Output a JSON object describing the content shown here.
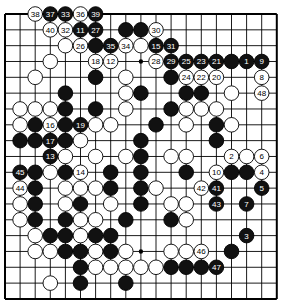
{
  "board": {
    "size": 19,
    "origin_x": 5,
    "origin_y": 14,
    "step_x": 15.1,
    "step_y": 15.83,
    "stone_radius": 7.3,
    "colors": {
      "line": "#000000",
      "black_stone": "#111111",
      "white_stone": "#ffffff",
      "black_label": "#ffffff",
      "white_label": "#000000"
    },
    "star_points": [
      [
        9,
        3
      ],
      [
        9,
        15
      ]
    ],
    "stones": [
      {
        "c": 2,
        "r": 0,
        "color": "W",
        "label": "38"
      },
      {
        "c": 3,
        "r": 0,
        "color": "B",
        "label": "37"
      },
      {
        "c": 4,
        "r": 0,
        "color": "B",
        "label": "33"
      },
      {
        "c": 5,
        "r": 0,
        "color": "W",
        "label": "36"
      },
      {
        "c": 6,
        "r": 0,
        "color": "B",
        "label": "39"
      },
      {
        "c": 3,
        "r": 1,
        "color": "W",
        "label": "40"
      },
      {
        "c": 4,
        "r": 1,
        "color": "W",
        "label": "32"
      },
      {
        "c": 5,
        "r": 1,
        "color": "B",
        "label": "11"
      },
      {
        "c": 6,
        "r": 1,
        "color": "B",
        "label": "27"
      },
      {
        "c": 8,
        "r": 1,
        "color": "B",
        "label": ""
      },
      {
        "c": 9,
        "r": 1,
        "color": "B",
        "label": ""
      },
      {
        "c": 10,
        "r": 1,
        "color": "W",
        "label": "30"
      },
      {
        "c": 4,
        "r": 2,
        "color": "W",
        "label": ""
      },
      {
        "c": 5,
        "r": 2,
        "color": "W",
        "label": "26"
      },
      {
        "c": 6,
        "r": 2,
        "color": "B",
        "label": ""
      },
      {
        "c": 7,
        "r": 2,
        "color": "B",
        "label": "35"
      },
      {
        "c": 8,
        "r": 2,
        "color": "W",
        "label": "34"
      },
      {
        "c": 9,
        "r": 2,
        "color": "W",
        "label": ""
      },
      {
        "c": 10,
        "r": 2,
        "color": "B",
        "label": "15"
      },
      {
        "c": 11,
        "r": 2,
        "color": "B",
        "label": "31"
      },
      {
        "c": 3,
        "r": 3,
        "color": "W",
        "label": ""
      },
      {
        "c": 6,
        "r": 3,
        "color": "W",
        "label": "18"
      },
      {
        "c": 7,
        "r": 3,
        "color": "W",
        "label": "12"
      },
      {
        "c": 10,
        "r": 3,
        "color": "W",
        "label": "28"
      },
      {
        "c": 11,
        "r": 3,
        "color": "B",
        "label": "29"
      },
      {
        "c": 12,
        "r": 3,
        "color": "B",
        "label": "25"
      },
      {
        "c": 13,
        "r": 3,
        "color": "B",
        "label": "23"
      },
      {
        "c": 14,
        "r": 3,
        "color": "B",
        "label": "21"
      },
      {
        "c": 15,
        "r": 3,
        "color": "B",
        "label": ""
      },
      {
        "c": 16,
        "r": 3,
        "color": "B",
        "label": "1"
      },
      {
        "c": 17,
        "r": 3,
        "color": "B",
        "label": "9"
      },
      {
        "c": 2,
        "r": 4,
        "color": "W",
        "label": ""
      },
      {
        "c": 6,
        "r": 4,
        "color": "B",
        "label": ""
      },
      {
        "c": 8,
        "r": 4,
        "color": "W",
        "label": ""
      },
      {
        "c": 11,
        "r": 4,
        "color": "B",
        "label": ""
      },
      {
        "c": 12,
        "r": 4,
        "color": "W",
        "label": "24"
      },
      {
        "c": 13,
        "r": 4,
        "color": "W",
        "label": "22"
      },
      {
        "c": 14,
        "r": 4,
        "color": "W",
        "label": "20"
      },
      {
        "c": 17,
        "r": 4,
        "color": "W",
        "label": "8"
      },
      {
        "c": 4,
        "r": 5,
        "color": "B",
        "label": ""
      },
      {
        "c": 8,
        "r": 5,
        "color": "W",
        "label": ""
      },
      {
        "c": 9,
        "r": 5,
        "color": "B",
        "label": ""
      },
      {
        "c": 12,
        "r": 5,
        "color": "B",
        "label": ""
      },
      {
        "c": 13,
        "r": 5,
        "color": "B",
        "label": ""
      },
      {
        "c": 15,
        "r": 5,
        "color": "W",
        "label": ""
      },
      {
        "c": 17,
        "r": 5,
        "color": "W",
        "label": "48"
      },
      {
        "c": 1,
        "r": 6,
        "color": "W",
        "label": ""
      },
      {
        "c": 2,
        "r": 6,
        "color": "W",
        "label": ""
      },
      {
        "c": 3,
        "r": 6,
        "color": "W",
        "label": ""
      },
      {
        "c": 4,
        "r": 6,
        "color": "B",
        "label": ""
      },
      {
        "c": 6,
        "r": 6,
        "color": "B",
        "label": ""
      },
      {
        "c": 8,
        "r": 6,
        "color": "W",
        "label": ""
      },
      {
        "c": 11,
        "r": 6,
        "color": "B",
        "label": ""
      },
      {
        "c": 12,
        "r": 6,
        "color": "W",
        "label": ""
      },
      {
        "c": 13,
        "r": 6,
        "color": "W",
        "label": ""
      },
      {
        "c": 14,
        "r": 6,
        "color": "W",
        "label": ""
      },
      {
        "c": 1,
        "r": 7,
        "color": "W",
        "label": ""
      },
      {
        "c": 2,
        "r": 7,
        "color": "B",
        "label": ""
      },
      {
        "c": 3,
        "r": 7,
        "color": "W",
        "label": "16"
      },
      {
        "c": 4,
        "r": 7,
        "color": "B",
        "label": ""
      },
      {
        "c": 5,
        "r": 7,
        "color": "B",
        "label": "19"
      },
      {
        "c": 6,
        "r": 7,
        "color": "W",
        "label": ""
      },
      {
        "c": 7,
        "r": 7,
        "color": "W",
        "label": ""
      },
      {
        "c": 10,
        "r": 7,
        "color": "B",
        "label": ""
      },
      {
        "c": 12,
        "r": 7,
        "color": "W",
        "label": ""
      },
      {
        "c": 14,
        "r": 7,
        "color": "B",
        "label": ""
      },
      {
        "c": 15,
        "r": 7,
        "color": "W",
        "label": ""
      },
      {
        "c": 1,
        "r": 8,
        "color": "B",
        "label": ""
      },
      {
        "c": 2,
        "r": 8,
        "color": "B",
        "label": ""
      },
      {
        "c": 3,
        "r": 8,
        "color": "B",
        "label": "17"
      },
      {
        "c": 4,
        "r": 8,
        "color": "B",
        "label": ""
      },
      {
        "c": 5,
        "r": 8,
        "color": "W",
        "label": ""
      },
      {
        "c": 9,
        "r": 8,
        "color": "B",
        "label": ""
      },
      {
        "c": 14,
        "r": 8,
        "color": "B",
        "label": ""
      },
      {
        "c": 3,
        "r": 9,
        "color": "B",
        "label": "13"
      },
      {
        "c": 4,
        "r": 9,
        "color": "W",
        "label": ""
      },
      {
        "c": 6,
        "r": 9,
        "color": "W",
        "label": ""
      },
      {
        "c": 8,
        "r": 9,
        "color": "W",
        "label": ""
      },
      {
        "c": 9,
        "r": 9,
        "color": "B",
        "label": ""
      },
      {
        "c": 11,
        "r": 9,
        "color": "W",
        "label": ""
      },
      {
        "c": 12,
        "r": 9,
        "color": "W",
        "label": ""
      },
      {
        "c": 15,
        "r": 9,
        "color": "W",
        "label": "2"
      },
      {
        "c": 16,
        "r": 9,
        "color": "W",
        "label": ""
      },
      {
        "c": 17,
        "r": 9,
        "color": "W",
        "label": "6"
      },
      {
        "c": 1,
        "r": 10,
        "color": "B",
        "label": "45"
      },
      {
        "c": 2,
        "r": 10,
        "color": "B",
        "label": ""
      },
      {
        "c": 3,
        "r": 10,
        "color": "W",
        "label": ""
      },
      {
        "c": 4,
        "r": 10,
        "color": "B",
        "label": ""
      },
      {
        "c": 5,
        "r": 10,
        "color": "W",
        "label": "14"
      },
      {
        "c": 7,
        "r": 10,
        "color": "B",
        "label": ""
      },
      {
        "c": 9,
        "r": 10,
        "color": "B",
        "label": ""
      },
      {
        "c": 12,
        "r": 10,
        "color": "B",
        "label": ""
      },
      {
        "c": 14,
        "r": 10,
        "color": "W",
        "label": "10"
      },
      {
        "c": 15,
        "r": 10,
        "color": "B",
        "label": ""
      },
      {
        "c": 16,
        "r": 10,
        "color": "B",
        "label": ""
      },
      {
        "c": 17,
        "r": 10,
        "color": "W",
        "label": "4"
      },
      {
        "c": 1,
        "r": 11,
        "color": "W",
        "label": "44"
      },
      {
        "c": 2,
        "r": 11,
        "color": "B",
        "label": ""
      },
      {
        "c": 4,
        "r": 11,
        "color": "W",
        "label": ""
      },
      {
        "c": 5,
        "r": 11,
        "color": "W",
        "label": ""
      },
      {
        "c": 6,
        "r": 11,
        "color": "W",
        "label": ""
      },
      {
        "c": 7,
        "r": 11,
        "color": "B",
        "label": ""
      },
      {
        "c": 9,
        "r": 11,
        "color": "B",
        "label": ""
      },
      {
        "c": 10,
        "r": 11,
        "color": "W",
        "label": ""
      },
      {
        "c": 13,
        "r": 11,
        "color": "W",
        "label": "42"
      },
      {
        "c": 14,
        "r": 11,
        "color": "B",
        "label": "41"
      },
      {
        "c": 17,
        "r": 11,
        "color": "B",
        "label": "5"
      },
      {
        "c": 1,
        "r": 12,
        "color": "W",
        "label": ""
      },
      {
        "c": 2,
        "r": 12,
        "color": "B",
        "label": ""
      },
      {
        "c": 4,
        "r": 12,
        "color": "W",
        "label": ""
      },
      {
        "c": 5,
        "r": 12,
        "color": "B",
        "label": ""
      },
      {
        "c": 7,
        "r": 12,
        "color": "W",
        "label": ""
      },
      {
        "c": 9,
        "r": 12,
        "color": "B",
        "label": ""
      },
      {
        "c": 11,
        "r": 12,
        "color": "W",
        "label": ""
      },
      {
        "c": 12,
        "r": 12,
        "color": "W",
        "label": ""
      },
      {
        "c": 14,
        "r": 12,
        "color": "B",
        "label": "43"
      },
      {
        "c": 16,
        "r": 12,
        "color": "B",
        "label": "7"
      },
      {
        "c": 1,
        "r": 13,
        "color": "W",
        "label": ""
      },
      {
        "c": 2,
        "r": 13,
        "color": "B",
        "label": ""
      },
      {
        "c": 4,
        "r": 13,
        "color": "B",
        "label": ""
      },
      {
        "c": 5,
        "r": 13,
        "color": "W",
        "label": ""
      },
      {
        "c": 6,
        "r": 13,
        "color": "W",
        "label": ""
      },
      {
        "c": 8,
        "r": 13,
        "color": "B",
        "label": ""
      },
      {
        "c": 11,
        "r": 13,
        "color": "B",
        "label": ""
      },
      {
        "c": 12,
        "r": 13,
        "color": "W",
        "label": ""
      },
      {
        "c": 2,
        "r": 14,
        "color": "W",
        "label": ""
      },
      {
        "c": 3,
        "r": 14,
        "color": "B",
        "label": ""
      },
      {
        "c": 4,
        "r": 14,
        "color": "B",
        "label": ""
      },
      {
        "c": 5,
        "r": 14,
        "color": "W",
        "label": ""
      },
      {
        "c": 6,
        "r": 14,
        "color": "B",
        "label": ""
      },
      {
        "c": 7,
        "r": 14,
        "color": "B",
        "label": ""
      },
      {
        "c": 16,
        "r": 14,
        "color": "B",
        "label": "3"
      },
      {
        "c": 2,
        "r": 15,
        "color": "W",
        "label": ""
      },
      {
        "c": 3,
        "r": 15,
        "color": "W",
        "label": ""
      },
      {
        "c": 4,
        "r": 15,
        "color": "B",
        "label": ""
      },
      {
        "c": 5,
        "r": 15,
        "color": "B",
        "label": ""
      },
      {
        "c": 6,
        "r": 15,
        "color": "W",
        "label": ""
      },
      {
        "c": 7,
        "r": 15,
        "color": "B",
        "label": ""
      },
      {
        "c": 8,
        "r": 15,
        "color": "W",
        "label": ""
      },
      {
        "c": 11,
        "r": 15,
        "color": "W",
        "label": ""
      },
      {
        "c": 12,
        "r": 15,
        "color": "W",
        "label": ""
      },
      {
        "c": 13,
        "r": 15,
        "color": "W",
        "label": "46"
      },
      {
        "c": 15,
        "r": 15,
        "color": "B",
        "label": ""
      },
      {
        "c": 5,
        "r": 16,
        "color": "B",
        "label": ""
      },
      {
        "c": 6,
        "r": 16,
        "color": "W",
        "label": ""
      },
      {
        "c": 7,
        "r": 16,
        "color": "W",
        "label": ""
      },
      {
        "c": 8,
        "r": 16,
        "color": "W",
        "label": ""
      },
      {
        "c": 9,
        "r": 16,
        "color": "W",
        "label": ""
      },
      {
        "c": 10,
        "r": 16,
        "color": "W",
        "label": ""
      },
      {
        "c": 11,
        "r": 16,
        "color": "B",
        "label": ""
      },
      {
        "c": 12,
        "r": 16,
        "color": "B",
        "label": ""
      },
      {
        "c": 13,
        "r": 16,
        "color": "B",
        "label": ""
      },
      {
        "c": 14,
        "r": 16,
        "color": "B",
        "label": "47"
      },
      {
        "c": 3,
        "r": 17,
        "color": "W",
        "label": ""
      },
      {
        "c": 5,
        "r": 17,
        "color": "B",
        "label": ""
      },
      {
        "c": 8,
        "r": 17,
        "color": "B",
        "label": ""
      }
    ]
  }
}
